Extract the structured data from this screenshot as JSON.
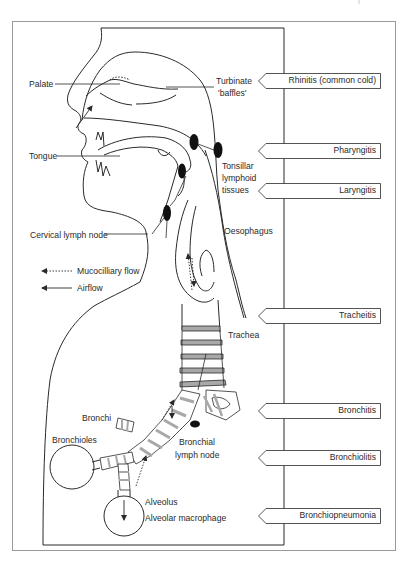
{
  "figure": {
    "type": "anatomical diagram",
    "colors": {
      "line": "#2a2a2a",
      "frame": "#9a9a9a",
      "cartilage_band": "#a8a8a8",
      "lymph_node": "#111111",
      "background": "#ffffff"
    }
  },
  "anatomy_labels": {
    "palate": "Palate",
    "turbinate_line1": "Turbinate",
    "turbinate_line2": "'baffles'",
    "tongue": "Tongue",
    "tonsillar_line1": "Tonsillar",
    "tonsillar_line2": "lymphoid",
    "tonsillar_line3": "tissues",
    "cervical_lymph_node": "Cervical lymph node",
    "oesophagus": "Oesophagus",
    "trachea": "Trachea",
    "bronchi": "Bronchi",
    "bronchioles": "Bronchioles",
    "bronchial_line1": "Bronchial",
    "bronchial_line2": "lymph node",
    "alveolus": "Alveolus",
    "alveolar_macrophage": "Alveolar macrophage"
  },
  "legend": {
    "items": [
      {
        "style": "dotted-arrow",
        "label": "Mucocilliary flow"
      },
      {
        "style": "solid-arrow",
        "label": "Airflow"
      }
    ]
  },
  "diseases": [
    {
      "label": "Rhinitis (common cold)",
      "site": "nasal cavity"
    },
    {
      "label": "Pharyngitis",
      "site": "pharynx"
    },
    {
      "label": "Laryngitis",
      "site": "larynx"
    },
    {
      "label": "Tracheitis",
      "site": "trachea"
    },
    {
      "label": "Bronchitis",
      "site": "bronchi"
    },
    {
      "label": "Bronchiolitis",
      "site": "bronchioles"
    },
    {
      "label": "Bronchiopneumonia",
      "site": "alveoli"
    }
  ]
}
